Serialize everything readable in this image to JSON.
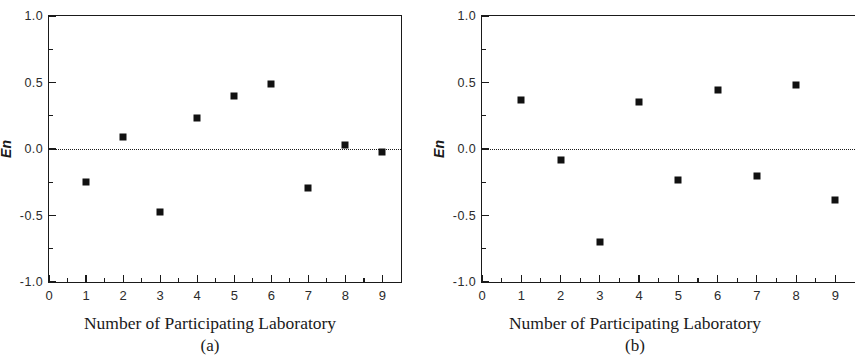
{
  "figure": {
    "background": "#ffffff",
    "marker_color": "#111111",
    "axis_color": "#1a1a1a"
  },
  "panels": [
    {
      "caption": "(a)",
      "xlabel": "Number of Participating Laboratory",
      "ylabel": "En"
    },
    {
      "caption": "(b)",
      "xlabel": "Number of Participating Laboratory",
      "ylabel": "En"
    }
  ],
  "axis": {
    "y_ticks": [
      "1.0",
      "0.5",
      "0.0",
      "-0.5",
      "-1.0"
    ],
    "y_tick_values": [
      1.0,
      0.5,
      0.0,
      -0.5,
      -1.0
    ],
    "y_minor_values": [
      0.75,
      0.25,
      -0.25,
      -0.75
    ],
    "x_ticks": [
      "0",
      "1",
      "2",
      "3",
      "4",
      "5",
      "6",
      "7",
      "8",
      "9"
    ],
    "x_tick_values": [
      0,
      1,
      2,
      3,
      4,
      5,
      6,
      7,
      8,
      9
    ],
    "x_minor_values": [
      0.5,
      1.5,
      2.5,
      3.5,
      4.5,
      5.5,
      6.5,
      7.5,
      8.5
    ]
  },
  "chart_data": [
    {
      "type": "scatter",
      "title": "(a)",
      "xlabel": "Number of Participating Laboratory",
      "ylabel": "En",
      "xlim": [
        0,
        9.5
      ],
      "ylim": [
        -1.0,
        1.0
      ],
      "grid": false,
      "legend": null,
      "reference_line": {
        "y": 0.0,
        "style": "dotted"
      },
      "x": [
        1,
        2,
        3,
        4,
        5,
        6,
        7,
        8,
        9
      ],
      "values": [
        -0.25,
        0.09,
        -0.47,
        0.23,
        0.4,
        0.49,
        -0.29,
        0.03,
        -0.02
      ]
    },
    {
      "type": "scatter",
      "title": "(b)",
      "xlabel": "Number of Participating Laboratory",
      "ylabel": "En",
      "xlim": [
        0,
        9.5
      ],
      "ylim": [
        -1.0,
        1.0
      ],
      "grid": false,
      "legend": null,
      "reference_line": {
        "y": 0.0,
        "style": "dotted"
      },
      "x": [
        1,
        2,
        3,
        4,
        5,
        6,
        7,
        8,
        9
      ],
      "values": [
        0.37,
        -0.08,
        -0.7,
        0.35,
        -0.23,
        0.44,
        -0.2,
        0.48,
        -0.38
      ]
    }
  ]
}
